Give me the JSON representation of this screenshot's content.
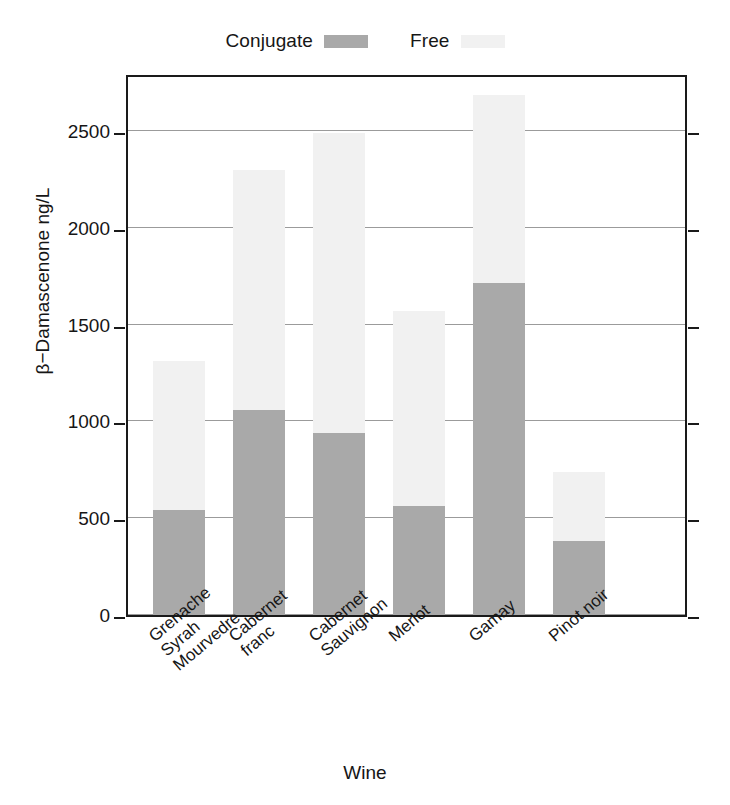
{
  "chart_data": {
    "type": "bar",
    "subtype": "stacked",
    "title": "",
    "xlabel": "Wine",
    "ylabel": "β−Damascenone ng/L",
    "ylim": [
      0,
      2800
    ],
    "yticks": [
      0,
      500,
      1000,
      1500,
      2000,
      2500
    ],
    "ytick_labels": [
      "0",
      "500",
      "1000",
      "1500",
      "2000",
      "2500"
    ],
    "grid": true,
    "grid_axis": "y",
    "legend_position": "top-center",
    "categories": [
      "Grenache\nSyrah\nMourvedre",
      "Cabernet\nfranc",
      "Cabernet\nSauvignon",
      "Merlot",
      "Gamay",
      "Pinot noir"
    ],
    "category_lines": [
      [
        "Grenache",
        "Syrah",
        "Mourvedre"
      ],
      [
        "Cabernet",
        "franc"
      ],
      [
        "Cabernet",
        "Sauvignon"
      ],
      [
        "Merlot"
      ],
      [
        "Gamay"
      ],
      [
        "Pinot noir"
      ]
    ],
    "series": [
      {
        "name": "Conjugate",
        "color": "#a9a9a9",
        "values": [
          540,
          1060,
          940,
          565,
          1715,
          380
        ]
      },
      {
        "name": "Free",
        "color": "#f1f1f1",
        "values": [
          770,
          1240,
          1550,
          1005,
          970,
          360
        ]
      }
    ],
    "totals": [
      1310,
      2300,
      2490,
      1570,
      2685,
      740
    ]
  },
  "legend": {
    "entries": [
      {
        "label": "Conjugate",
        "color": "#a9a9a9"
      },
      {
        "label": "Free",
        "color": "#f1f1f1"
      }
    ]
  },
  "axes": {
    "x_title": "Wine",
    "y_title": "β−Damascenone ng/L"
  }
}
